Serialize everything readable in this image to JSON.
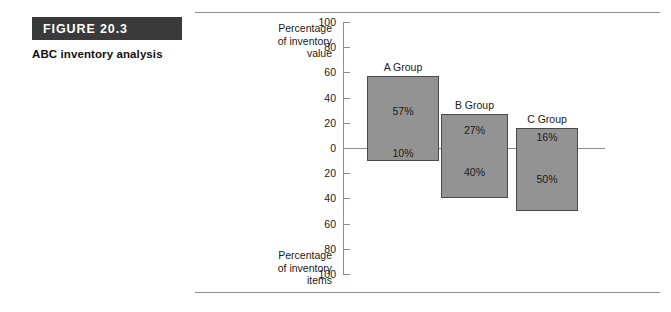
{
  "figure": {
    "tag": "FIGURE 20.3",
    "caption": "ABC inventory analysis"
  },
  "axis": {
    "top_caption": "Percentage\nof inventory\nvalue",
    "bottom_caption": "Percentage\nof inventory\nitems",
    "ticks": [
      "100",
      "80",
      "60",
      "40",
      "20",
      "0",
      "20",
      "40",
      "60",
      "80",
      "100"
    ]
  },
  "chart_data": {
    "type": "bar",
    "title": "ABC inventory analysis",
    "orientation": "vertical",
    "grid": false,
    "legend": false,
    "ylim": [
      -100,
      100
    ],
    "yticks": [
      100,
      80,
      60,
      40,
      20,
      0,
      -20,
      -40,
      -60,
      -80,
      -100
    ],
    "ytick_labels": [
      "100",
      "80",
      "60",
      "40",
      "20",
      "0",
      "20",
      "40",
      "60",
      "80",
      "100"
    ],
    "ylabel_top": "Percentage of inventory value",
    "ylabel_bottom": "Percentage of inventory items",
    "xlabel": "",
    "categories": [
      "A Group",
      "B Group",
      "C Group"
    ],
    "series": [
      {
        "name": "Percentage of inventory value",
        "direction": "up",
        "values": [
          57,
          27,
          16
        ],
        "labels": [
          "57%",
          "27%",
          "16%"
        ]
      },
      {
        "name": "Percentage of inventory items",
        "direction": "down",
        "values": [
          10,
          40,
          50
        ],
        "labels": [
          "10%",
          "40%",
          "50%"
        ]
      }
    ],
    "bar_fill": "#939393",
    "bar_stroke": "#4a4a4a"
  },
  "groups": [
    {
      "name": "A Group",
      "value_pct": "57%",
      "items_pct": "10%"
    },
    {
      "name": "B Group",
      "value_pct": "27%",
      "items_pct": "40%"
    },
    {
      "name": "C Group",
      "value_pct": "16%",
      "items_pct": "50%"
    }
  ]
}
